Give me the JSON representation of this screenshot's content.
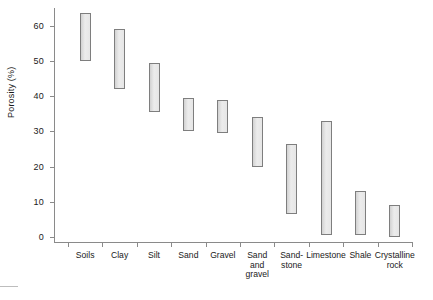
{
  "chart_data": {
    "type": "bar",
    "title": "",
    "subtitle": "",
    "xlabel": "",
    "ylabel": "Porosity (%)",
    "ylim": [
      0,
      65
    ],
    "yticks": [
      0,
      10,
      20,
      30,
      40,
      50,
      60
    ],
    "ytick_labels": [
      "0",
      "10",
      "20",
      "30",
      "40",
      "50",
      "60"
    ],
    "grid": false,
    "legend": null,
    "bar_style": "floating range bars (low-high)",
    "categories": [
      "Soils",
      "Clay",
      "Silt",
      "Sand",
      "Gravel",
      "Sand\nand\ngravel",
      "Sand-\nstone",
      "Limestone",
      "Shale",
      "Crystalline\nrock"
    ],
    "series": [
      {
        "name": "Porosity low",
        "values": [
          50,
          42,
          35.5,
          30,
          29.5,
          20,
          6.5,
          0.5,
          0.5,
          0
        ]
      },
      {
        "name": "Porosity high",
        "values": [
          63.5,
          59,
          49.5,
          39.5,
          39,
          34,
          26.5,
          33,
          13,
          9
        ]
      }
    ],
    "ranges": [
      {
        "category": "Soils",
        "low": 50,
        "high": 63.5
      },
      {
        "category": "Clay",
        "low": 42,
        "high": 59
      },
      {
        "category": "Silt",
        "low": 35.5,
        "high": 49.5
      },
      {
        "category": "Sand",
        "low": 30,
        "high": 39.5
      },
      {
        "category": "Gravel",
        "low": 29.5,
        "high": 39
      },
      {
        "category": "Sand and gravel",
        "low": 20,
        "high": 34
      },
      {
        "category": "Sandstone",
        "low": 6.5,
        "high": 26.5
      },
      {
        "category": "Limestone",
        "low": 0.5,
        "high": 33
      },
      {
        "category": "Shale",
        "low": 0.5,
        "high": 13
      },
      {
        "category": "Crystalline rock",
        "low": 0,
        "high": 9
      }
    ],
    "colors": {
      "bar_fill": "#e2e2e2",
      "bar_stroke": "#7e7e7e",
      "axis": "#8a8a8a",
      "text": "#1a1a1a",
      "background": "#ffffff"
    }
  },
  "axes": {
    "y_title": "Porosity (%)"
  },
  "caption": {
    "rule": "",
    "text": ""
  }
}
